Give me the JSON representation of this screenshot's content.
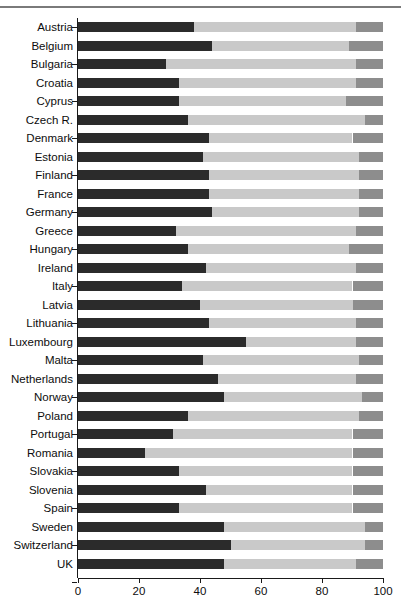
{
  "chart_data": {
    "type": "bar",
    "orientation": "horizontal",
    "stacked": true,
    "title": "",
    "xlabel": "",
    "ylabel": "",
    "xlim": [
      0,
      100
    ],
    "xticks": [
      0,
      20,
      40,
      60,
      80,
      100
    ],
    "xtick_labels": [
      "0",
      "20",
      "40",
      "60",
      "80",
      "100"
    ],
    "grid": false,
    "legend": "none",
    "categories": [
      "Austria",
      "Belgium",
      "Bulgaria",
      "Croatia",
      "Cyprus",
      "Czech R.",
      "Denmark",
      "Estonia",
      "Finland",
      "France",
      "Germany",
      "Greece",
      "Hungary",
      "Ireland",
      "Italy",
      "Latvia",
      "Lithuania",
      "Luxembourg",
      "Malta",
      "Netherlands",
      "Norway",
      "Poland",
      "Portugal",
      "Romania",
      "Slovakia",
      "Slovenia",
      "Spain",
      "Sweden",
      "Switzerland",
      "UK"
    ],
    "series": [
      {
        "name": "segment-dark",
        "color": "#2b2b2b",
        "values": [
          38,
          44,
          29,
          33,
          33,
          36,
          43,
          41,
          43,
          43,
          44,
          32,
          36,
          42,
          34,
          40,
          43,
          55,
          41,
          46,
          48,
          36,
          31,
          22,
          33,
          42,
          33,
          48,
          50,
          48
        ]
      },
      {
        "name": "segment-light",
        "color": "#c9c9c9",
        "values": [
          53,
          45,
          62,
          58,
          55,
          58,
          47,
          51,
          49,
          49,
          48,
          59,
          53,
          49,
          56,
          50,
          48,
          36,
          51,
          45,
          45,
          56,
          59,
          68,
          57,
          48,
          57,
          46,
          44,
          43
        ]
      },
      {
        "name": "segment-medium",
        "color": "#8d8d8d",
        "values": [
          9,
          11,
          9,
          9,
          12,
          6,
          10,
          8,
          8,
          8,
          8,
          9,
          11,
          9,
          10,
          10,
          9,
          9,
          8,
          9,
          7,
          8,
          10,
          10,
          10,
          10,
          10,
          6,
          6,
          9
        ]
      }
    ],
    "segment_boundaries_percent": [
      {
        "category": "Austria",
        "a_end": 38,
        "b_end": 91
      },
      {
        "category": "Belgium",
        "a_end": 44,
        "b_end": 89
      },
      {
        "category": "Bulgaria",
        "a_end": 29,
        "b_end": 91
      },
      {
        "category": "Croatia",
        "a_end": 33,
        "b_end": 91
      },
      {
        "category": "Cyprus",
        "a_end": 33,
        "b_end": 88
      },
      {
        "category": "Czech R.",
        "a_end": 36,
        "b_end": 94
      },
      {
        "category": "Denmark",
        "a_end": 43,
        "b_end": 90
      },
      {
        "category": "Estonia",
        "a_end": 41,
        "b_end": 92
      },
      {
        "category": "Finland",
        "a_end": 43,
        "b_end": 92
      },
      {
        "category": "France",
        "a_end": 43,
        "b_end": 92
      },
      {
        "category": "Germany",
        "a_end": 44,
        "b_end": 92
      },
      {
        "category": "Greece",
        "a_end": 32,
        "b_end": 91
      },
      {
        "category": "Hungary",
        "a_end": 36,
        "b_end": 89
      },
      {
        "category": "Ireland",
        "a_end": 42,
        "b_end": 91
      },
      {
        "category": "Italy",
        "a_end": 34,
        "b_end": 90
      },
      {
        "category": "Latvia",
        "a_end": 40,
        "b_end": 90
      },
      {
        "category": "Lithuania",
        "a_end": 43,
        "b_end": 91
      },
      {
        "category": "Luxembourg",
        "a_end": 55,
        "b_end": 91
      },
      {
        "category": "Malta",
        "a_end": 41,
        "b_end": 92
      },
      {
        "category": "Netherlands",
        "a_end": 46,
        "b_end": 91
      },
      {
        "category": "Norway",
        "a_end": 48,
        "b_end": 93
      },
      {
        "category": "Poland",
        "a_end": 36,
        "b_end": 92
      },
      {
        "category": "Portugal",
        "a_end": 31,
        "b_end": 90
      },
      {
        "category": "Romania",
        "a_end": 22,
        "b_end": 90
      },
      {
        "category": "Slovakia",
        "a_end": 33,
        "b_end": 90
      },
      {
        "category": "Slovenia",
        "a_end": 42,
        "b_end": 90
      },
      {
        "category": "Spain",
        "a_end": 33,
        "b_end": 90
      },
      {
        "category": "Sweden",
        "a_end": 48,
        "b_end": 94
      },
      {
        "category": "Switzerland",
        "a_end": 50,
        "b_end": 94
      },
      {
        "category": "UK",
        "a_end": 48,
        "b_end": 91
      }
    ]
  },
  "colors": {
    "segment_dark": "#2b2b2b",
    "segment_light": "#c9c9c9",
    "segment_medium": "#8d8d8d",
    "axis": "#1a1a1a",
    "text": "#0d0d0d",
    "background": "#ffffff"
  }
}
